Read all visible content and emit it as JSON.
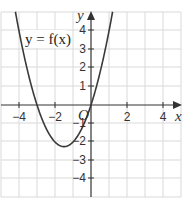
{
  "chart_data": {
    "type": "line",
    "title": "",
    "xlabel": "x",
    "ylabel": "y",
    "xlim": [
      -5,
      5
    ],
    "ylim": [
      -5,
      5
    ],
    "grid": true,
    "x_ticks": [
      "-4",
      "-2",
      "2",
      "4"
    ],
    "y_ticks": [
      "4",
      "3",
      "2",
      "1",
      "-1",
      "-2",
      "-3",
      "-4"
    ],
    "origin_label": "O",
    "series": [
      {
        "name": "y = f(x)",
        "equation": "y = x^2 + 3x",
        "x_intercepts": [
          -3,
          0
        ],
        "vertex": [
          -1.5,
          -2.25
        ],
        "x": [
          -5.2,
          -5,
          -4.5,
          -4,
          -3.5,
          -3,
          -2.5,
          -2,
          -1.5,
          -1,
          -0.5,
          0,
          0.5,
          1,
          1.2
        ],
        "y": [
          11.44,
          10,
          6.75,
          4,
          1.75,
          0,
          -1.25,
          -2,
          -2.25,
          -2,
          -1.25,
          0,
          1.75,
          4,
          5.04
        ]
      }
    ],
    "annotations": [
      {
        "text": "y = f(x)",
        "x": -3.6,
        "y": 3.3
      }
    ]
  },
  "labels": {
    "function": "y = f(x)",
    "x_axis": "x",
    "y_axis": "y",
    "origin": "O",
    "xt_m4": "−4",
    "xt_m2": "−2",
    "xt_2": "2",
    "xt_4": "4",
    "yt_4": "4",
    "yt_3": "3",
    "yt_2": "2",
    "yt_1": "1",
    "yt_m1": "−1",
    "yt_m2": "−2",
    "yt_m3": "−3",
    "yt_m4": "−4"
  },
  "colors": {
    "grid": "#d9d9d9",
    "axis": "#333333",
    "curve": "#3a3a3a"
  }
}
